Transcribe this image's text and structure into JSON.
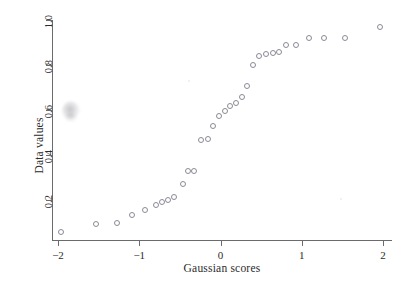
{
  "chart_data": {
    "type": "scatter",
    "title": "",
    "xlabel": "Gaussian scores",
    "ylabel": "Data values",
    "xlim": [
      -2.12,
      2.1
    ],
    "ylim": [
      0.02,
      1.02
    ],
    "xticks": [
      -2,
      -1,
      0,
      1,
      2
    ],
    "xtick_labels": [
      "−2",
      "−1",
      "0",
      "1",
      "2"
    ],
    "yticks": [
      0.2,
      0.4,
      0.6,
      0.8,
      1.0
    ],
    "ytick_labels": [
      "0.2",
      "0.4",
      "0.6",
      "0.8",
      "1.0"
    ],
    "grid": false,
    "legend": null,
    "marker": "open-circle",
    "marker_color": "#8a8a96",
    "series": [
      {
        "name": "Normal probability plot",
        "x": [
          -1.96,
          -1.53,
          -1.27,
          -1.09,
          -0.93,
          -0.8,
          -0.72,
          -0.65,
          -0.57,
          -0.46,
          -0.4,
          -0.33,
          -0.24,
          -0.16,
          -0.09,
          -0.02,
          0.05,
          0.12,
          0.19,
          0.26,
          0.33,
          0.4,
          0.47,
          0.56,
          0.65,
          0.72,
          0.8,
          0.93,
          1.09,
          1.27,
          1.53,
          1.96
        ],
        "y": [
          0.057,
          0.093,
          0.098,
          0.133,
          0.157,
          0.18,
          0.192,
          0.2,
          0.213,
          0.272,
          0.328,
          0.33,
          0.467,
          0.47,
          0.53,
          0.572,
          0.595,
          0.62,
          0.632,
          0.658,
          0.705,
          0.8,
          0.838,
          0.85,
          0.852,
          0.858,
          0.89,
          0.888,
          0.92,
          0.918,
          0.918,
          0.967
        ]
      }
    ]
  },
  "artifacts": {
    "smudge_label": "scan-smudge"
  }
}
